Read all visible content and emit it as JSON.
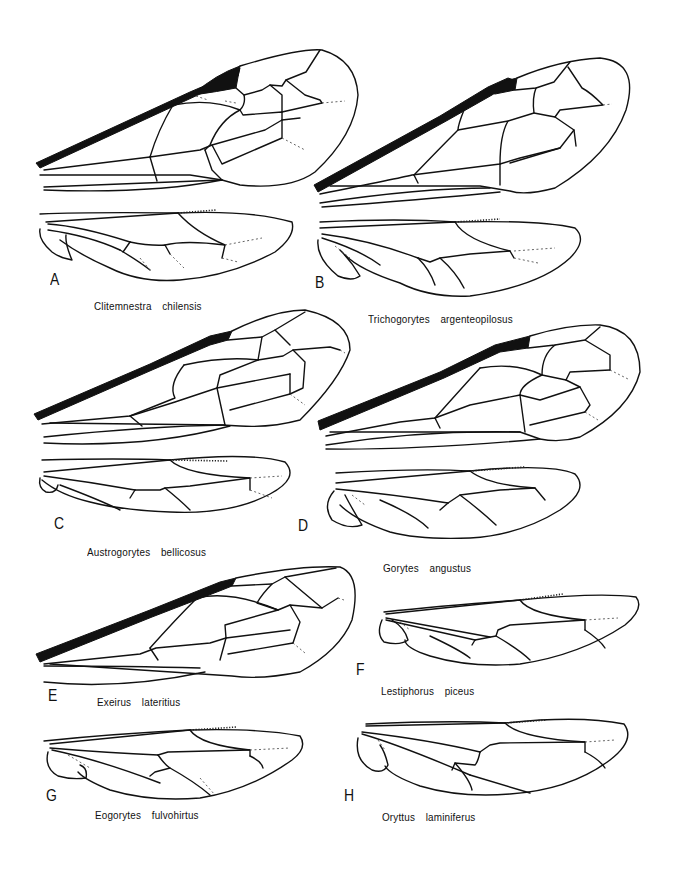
{
  "figure": {
    "type": "wing venation plate",
    "panels": [
      {
        "letter": "A",
        "species": "Clitemnestra  chilensis"
      },
      {
        "letter": "B",
        "species": "Trichogorytes  argenteopilosus"
      },
      {
        "letter": "C",
        "species": "Austrogorytes  bellicosus"
      },
      {
        "letter": "D",
        "species": "Gorytes  angustus"
      },
      {
        "letter": "E",
        "species": "Exeirus  lateritius"
      },
      {
        "letter": "F",
        "species": "Lestiphorus  piceus"
      },
      {
        "letter": "G",
        "species": "Eogorytes  fulvohirtus"
      },
      {
        "letter": "H",
        "species": "Oryttus  laminiferus"
      }
    ],
    "panel_contents": {
      "A": [
        "forewing",
        "hindwing"
      ],
      "B": [
        "forewing",
        "hindwing"
      ],
      "C": [
        "forewing",
        "hindwing"
      ],
      "D": [
        "forewing",
        "hindwing"
      ],
      "E": [
        "forewing"
      ],
      "F": [
        "hindwing"
      ],
      "G": [
        "hindwing"
      ],
      "H": [
        "hindwing"
      ]
    },
    "colors": {
      "ink": "#111111",
      "background": "#ffffff"
    }
  }
}
